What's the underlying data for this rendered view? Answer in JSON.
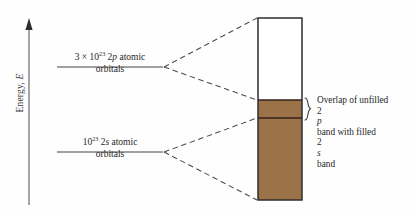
{
  "figure": {
    "type": "energy-band-diagram",
    "background_color": "#fefefe",
    "line_color": "#3a3a3a",
    "band_fill_color": "#9c7348",
    "band_empty_color": "#ffffff"
  },
  "axis": {
    "label_text": "Energy, ",
    "label_symbol": "E",
    "direction": "up",
    "tip_y": 20,
    "base_y": 205,
    "x": 29
  },
  "levels": [
    {
      "id": "2p",
      "count_prefix": "3 × 10",
      "count_exponent": "23",
      "orbital_label": " 2",
      "orbital_symbol": "p",
      "orbital_suffix": " atomic",
      "second_line": "orbitals",
      "line_y": 67,
      "line_x1": 57,
      "line_x2": 163
    },
    {
      "id": "2s",
      "count_prefix": "10",
      "count_exponent": "23",
      "orbital_label": " 2",
      "orbital_symbol": "s",
      "orbital_suffix": " atomic",
      "second_line": "orbitals",
      "line_y": 152,
      "line_x1": 57,
      "line_x2": 163
    }
  ],
  "band_block": {
    "x_left": 258,
    "x_right": 302,
    "y_top": 18,
    "y_bottom": 200,
    "overlap_top_y": 100,
    "overlap_bottom_y": 118,
    "empty_region_label": "unfilled 2p band",
    "filled_region_label": "filled 2s band"
  },
  "annotation": {
    "line1": "Overlap of unfilled",
    "line2_pre": "2",
    "line2_symbol": "p",
    "line2_post": " band with filled",
    "line3_pre": "2",
    "line3_symbol": "s",
    "line3_post": " band",
    "brace": "brace-right"
  }
}
